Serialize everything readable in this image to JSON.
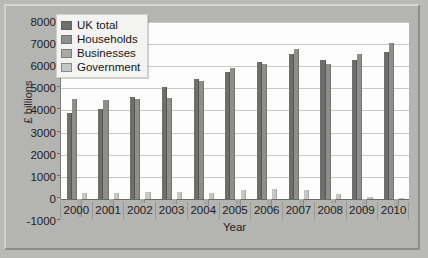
{
  "chart_data": {
    "type": "bar",
    "title": "",
    "xlabel": "Year",
    "ylabel": "£ billions",
    "categories": [
      "2000",
      "2001",
      "2002",
      "2003",
      "2004",
      "2005",
      "2006",
      "2007",
      "2008",
      "2009",
      "2010"
    ],
    "series": [
      {
        "name": "UK total",
        "color": "#6e6e6c",
        "values": [
          3900,
          4050,
          4600,
          5050,
          5400,
          5750,
          6200,
          6550,
          6300,
          6300,
          6650
        ]
      },
      {
        "name": "Households",
        "color": "#8e8e8c",
        "values": [
          4500,
          4450,
          4500,
          4550,
          5350,
          5900,
          6100,
          6800,
          6100,
          6550,
          7050
        ]
      },
      {
        "name": "Businesses",
        "color": "#a9a9a7",
        "values": [
          -800,
          -730,
          -170,
          -230,
          -300,
          -400,
          -470,
          -480,
          -200,
          -550,
          -330
        ]
      },
      {
        "name": "Government",
        "color": "#c6c6c4",
        "values": [
          270,
          280,
          290,
          290,
          280,
          400,
          430,
          420,
          240,
          90,
          60
        ]
      }
    ],
    "ylim": [
      -1000,
      8000
    ],
    "ytick_step": 1000,
    "yticks": [
      "8000",
      "7000",
      "6000",
      "5000",
      "4000",
      "3000",
      "2000",
      "1000",
      "0",
      "-1000"
    ],
    "grid": true,
    "legend_position": "top-left-inside",
    "background_color": "#b9b9b7",
    "plot_background_color": "#fdfdfd"
  },
  "legend": {
    "items": [
      {
        "label": "UK total"
      },
      {
        "label": "Households"
      },
      {
        "label": "Businesses"
      },
      {
        "label": "Government"
      }
    ]
  }
}
